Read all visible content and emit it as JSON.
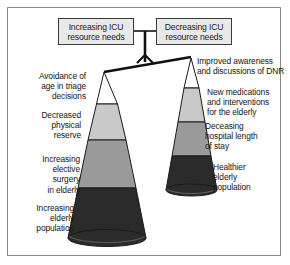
{
  "figure": {
    "background_color": "#ffffff",
    "frame_color": "#8a8a8a"
  },
  "balance": {
    "left_box": "Increasing ICU\nresource needs",
    "right_box": "Decreasing ICU\nresource needs",
    "tilt": "left side down",
    "beam_color": "#111111",
    "post_color": "#111111"
  },
  "left_cone": {
    "labels": [
      "Avoidance of\nage in triage\ndecisions",
      "Decreased\nphysical\nreserve",
      "Increasing\nelective\nsurgery\nin elderly",
      "Increasing\nelderly\npopulation"
    ],
    "bands": [
      {
        "name": "Avoidance of age in triage decisions",
        "color": "#ffffff"
      },
      {
        "name": "Decreased physical reserve",
        "color": "#c9c9c9"
      },
      {
        "name": "Increasing elective surgery in elderly",
        "color": "#9a9a9a"
      },
      {
        "name": "Increasing elderly population",
        "color": "#2b2b2b"
      }
    ]
  },
  "right_cone": {
    "labels": [
      "Improved awareness\nand discussions of DNR",
      "New medications\nand interventions\nfor the elderly",
      "Deceasing\nhospital length\nof stay",
      "Healthier\nelderly\npopulation"
    ],
    "bands": [
      {
        "name": "Improved awareness and discussions of DNR",
        "color": "#ffffff"
      },
      {
        "name": "New medications and interventions for the elderly",
        "color": "#c9c9c9"
      },
      {
        "name": "Deceasing hospital length of stay",
        "color": "#9a9a9a"
      },
      {
        "name": "Healthier elderly population",
        "color": "#2b2b2b"
      }
    ]
  }
}
